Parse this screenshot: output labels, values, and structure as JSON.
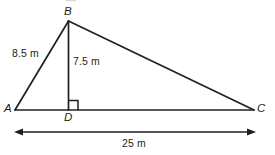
{
  "figure": {
    "background_color": "#ffffff",
    "stroke_color": "#231f20",
    "text_color": "#231f20"
  },
  "vertices": {
    "B": "B",
    "A": "A",
    "D": "D",
    "C": "C"
  },
  "measurements": {
    "side_AB": "8.5 m",
    "altitude_BD": "7.5 m",
    "base_AC": "25 m"
  },
  "marks": {
    "right_angle_at_D": "right-angle-square",
    "dimension_arrow": "double-headed-arrow"
  },
  "geometry": {
    "points": {
      "A": [
        15,
        110
      ],
      "B": [
        68.5,
        21
      ],
      "C": [
        254,
        110
      ],
      "D": [
        68.5,
        110
      ]
    },
    "dimension_line": {
      "x1": 15,
      "x2": 255,
      "y": 132
    },
    "right_angle_square": {
      "x": 68.5,
      "y": 110,
      "size": 9
    }
  }
}
